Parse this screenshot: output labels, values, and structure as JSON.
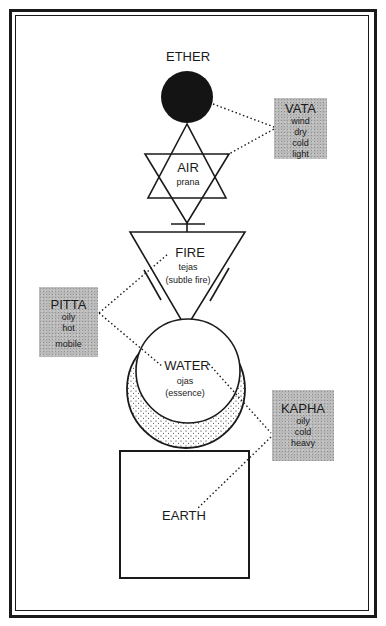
{
  "diagram": {
    "elements": {
      "ether": {
        "label": "ETHER"
      },
      "air": {
        "label": "AIR",
        "subtitle": "prana"
      },
      "fire": {
        "label": "FIRE",
        "subtitle": "tejas",
        "subtitle2": "(subtle fire)"
      },
      "water": {
        "label": "WATER",
        "subtitle": "ojas",
        "subtitle2": "(essence)"
      },
      "earth": {
        "label": "EARTH"
      }
    },
    "doshas": {
      "vata": {
        "title": "VATA",
        "qualities": [
          "wind",
          "dry",
          "cold",
          "light"
        ]
      },
      "pitta": {
        "title": "PITTA",
        "qualities": [
          "oily",
          "hot",
          "mobile"
        ]
      },
      "kapha": {
        "title": "KAPHA",
        "qualities": [
          "oily",
          "cold",
          "heavy"
        ]
      }
    },
    "colors": {
      "ink": "#1a1a1a",
      "dosha_box": "#b9b9b9",
      "background": "#ffffff"
    },
    "connections": [
      {
        "from": "vata",
        "to": [
          "ether",
          "air"
        ]
      },
      {
        "from": "pitta",
        "to": [
          "fire",
          "water"
        ]
      },
      {
        "from": "kapha",
        "to": [
          "water",
          "earth"
        ]
      }
    ]
  }
}
